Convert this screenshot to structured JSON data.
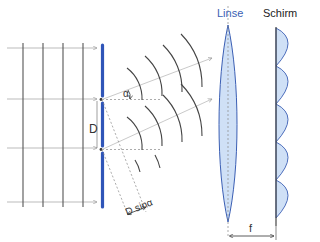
{
  "diagram": {
    "labels": {
      "lens": "Linse",
      "screen": "Schirm",
      "slit_distance": "D",
      "angle": "α",
      "path_difference": "D sinα",
      "focal_length": "f"
    },
    "colors": {
      "barrier": "#2f55b8",
      "lens_fill": "#cfe0f6",
      "lens_stroke": "#3b5fb4",
      "screen_fill": "#cfe0f6",
      "wavefront": "#444444",
      "ray": "#aaaaaa"
    },
    "elements": {
      "incoming_wavefronts": 4,
      "incoming_arrows": 4,
      "slits": 2,
      "diffracted_wavefronts_per_slit": 4,
      "intensity_maxima": 5
    }
  }
}
